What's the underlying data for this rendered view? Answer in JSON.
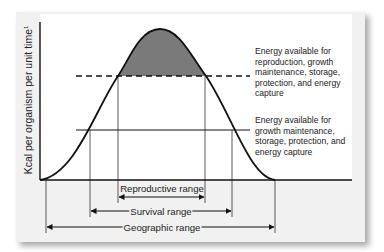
{
  "diagram": {
    "y_axis_label": "Kcal per organism per unit time",
    "y_axis_superscript": "1",
    "annotations": [
      {
        "id": "upper",
        "text": "Energy available for reproduction, growth maintenance, storage, protection, and energy capture"
      },
      {
        "id": "lower",
        "text": "Energy available for growth maintenance, storage, protection, and energy capture"
      }
    ],
    "ranges": [
      {
        "id": "reproductive",
        "label": "Reproductive range"
      },
      {
        "id": "survival",
        "label": "Survival range"
      },
      {
        "id": "geographic",
        "label": "Geographic range"
      }
    ],
    "colors": {
      "shaded_area": "#7a7a7a",
      "lines": "#111111",
      "card_background": "#f1f1f1",
      "plot_background": "#ffffff"
    }
  }
}
